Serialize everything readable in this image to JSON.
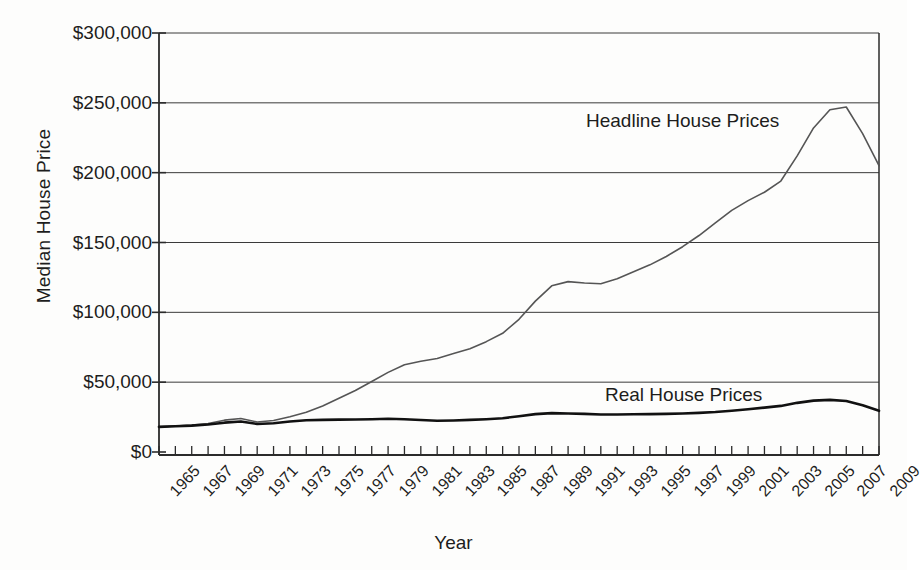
{
  "chart_data": {
    "type": "line",
    "title": "",
    "xlabel": "Year",
    "ylabel": "Median House Price",
    "xlim": [
      1965,
      2009
    ],
    "ylim": [
      0,
      300000
    ],
    "ytick_values": [
      0,
      50000,
      100000,
      150000,
      200000,
      250000,
      300000
    ],
    "ytick_labels": [
      "$0",
      "$50,000",
      "$100,000",
      "$150,000",
      "$200,000",
      "$250,000",
      "$300,000"
    ],
    "xtick_labels": [
      "1965",
      "1967",
      "1969",
      "1971",
      "1973",
      "1975",
      "1977",
      "1979",
      "1981",
      "1983",
      "1985",
      "1987",
      "1989",
      "1991",
      "1993",
      "1995",
      "1997",
      "1999",
      "2001",
      "2003",
      "2005",
      "2007",
      "2009"
    ],
    "grid": "horizontal",
    "legend_position": "inline-annotations",
    "x": [
      1965,
      1966,
      1967,
      1968,
      1969,
      1970,
      1971,
      1972,
      1973,
      1974,
      1975,
      1976,
      1977,
      1978,
      1979,
      1980,
      1981,
      1982,
      1983,
      1984,
      1985,
      1986,
      1987,
      1988,
      1989,
      1990,
      1991,
      1992,
      1993,
      1994,
      1995,
      1996,
      1997,
      1998,
      1999,
      2000,
      2001,
      2002,
      2003,
      2004,
      2005,
      2006,
      2007,
      2008,
      2009
    ],
    "series": [
      {
        "name": "Headline House Prices",
        "color": "#555555",
        "width": 1.6,
        "values": [
          18000,
          18600,
          19300,
          20400,
          22800,
          24000,
          21500,
          22600,
          25200,
          28500,
          33000,
          38500,
          44000,
          50500,
          57000,
          62500,
          65000,
          67000,
          70500,
          74000,
          79000,
          85000,
          95000,
          108000,
          119000,
          122000,
          121000,
          120500,
          124000,
          129000,
          134000,
          140000,
          147000,
          155000,
          164000,
          173000,
          180000,
          186000,
          194000,
          212000,
          232000,
          245000,
          247000,
          228000,
          205000
        ]
      },
      {
        "name": "Real House Prices",
        "color": "#111111",
        "width": 2.6,
        "values": [
          18000,
          18400,
          18900,
          19700,
          21000,
          21800,
          20100,
          20600,
          21800,
          22700,
          23000,
          23200,
          23300,
          23500,
          23800,
          23500,
          22900,
          22400,
          22600,
          23000,
          23500,
          24200,
          25600,
          27100,
          27800,
          27600,
          27300,
          26900,
          26900,
          27000,
          27100,
          27300,
          27600,
          28000,
          28600,
          29500,
          30600,
          31800,
          33000,
          35200,
          36800,
          37300,
          36500,
          33500,
          29500
        ]
      }
    ]
  },
  "axis": {
    "y_title": "Median House Price",
    "x_title": "Year"
  },
  "annotations": {
    "headline_label": "Headline House Prices",
    "real_label": "Real House Prices"
  }
}
